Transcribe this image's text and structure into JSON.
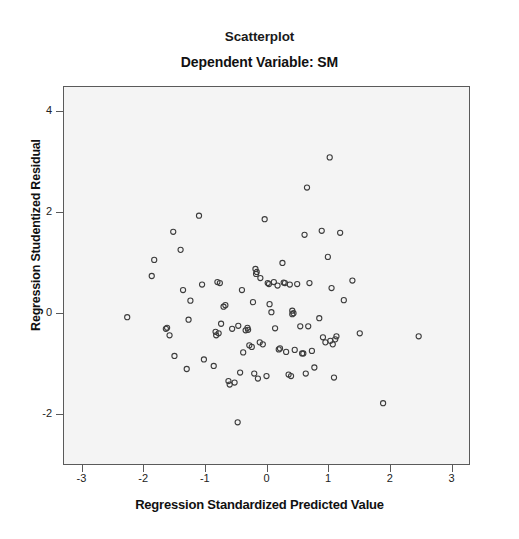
{
  "figure": {
    "title": "Scatterplot",
    "subtitle": "Dependent Variable: SM"
  },
  "chart_data": {
    "type": "scatter",
    "title": "Scatterplot",
    "subtitle": "Dependent Variable: SM",
    "xlabel": "Regression Standardized Predicted Value",
    "ylabel": "Regression Studentized Residual",
    "xlim": [
      -3.3,
      3.3
    ],
    "ylim": [
      -3.0,
      4.5
    ],
    "xticks": [
      -3,
      -2,
      -1,
      0,
      1,
      2,
      3
    ],
    "xtick_labels": [
      "-3",
      "-2",
      "-1",
      "0",
      "1",
      "2",
      "3"
    ],
    "yticks": [
      -2,
      0,
      2,
      4
    ],
    "ytick_labels": [
      "-2",
      "0",
      "2",
      "4"
    ],
    "grid": false,
    "legend": null,
    "marker": {
      "shape": "open-circle",
      "radius": 2.6,
      "stroke": "#3c3c3c",
      "stroke_width": 1.1,
      "fill": "none"
    },
    "plot_background": "#f4f4f4",
    "frame_color": "#5a5a5a",
    "n_points": 98,
    "points": [
      [
        -2.27,
        -0.08
      ],
      [
        -1.83,
        1.06
      ],
      [
        -1.87,
        0.74
      ],
      [
        -1.62,
        -0.29
      ],
      [
        -1.58,
        -0.44
      ],
      [
        -1.52,
        1.62
      ],
      [
        -1.5,
        -0.85
      ],
      [
        -1.4,
        1.26
      ],
      [
        -1.36,
        0.46
      ],
      [
        -1.3,
        -1.11
      ],
      [
        -1.24,
        0.25
      ],
      [
        -1.27,
        -0.13
      ],
      [
        -1.1,
        1.94
      ],
      [
        -1.05,
        0.57
      ],
      [
        -1.02,
        -0.92
      ],
      [
        -0.86,
        -1.05
      ],
      [
        -0.8,
        0.62
      ],
      [
        -0.76,
        0.6
      ],
      [
        -0.83,
        -0.37
      ],
      [
        -0.82,
        -0.44
      ],
      [
        -0.74,
        -0.21
      ],
      [
        -0.7,
        0.13
      ],
      [
        -0.67,
        0.16
      ],
      [
        -0.62,
        -1.35
      ],
      [
        -0.6,
        -1.42
      ],
      [
        -0.56,
        -0.31
      ],
      [
        -0.47,
        -2.17
      ],
      [
        -0.43,
        -1.18
      ],
      [
        -0.4,
        0.46
      ],
      [
        -0.38,
        -0.78
      ],
      [
        -0.34,
        -0.34
      ],
      [
        -0.3,
        -0.33
      ],
      [
        -0.28,
        -0.64
      ],
      [
        -0.24,
        -0.67
      ],
      [
        -0.22,
        0.22
      ],
      [
        -0.18,
        0.88
      ],
      [
        -0.17,
        0.78
      ],
      [
        -0.2,
        -1.2
      ],
      [
        -0.14,
        -1.3
      ],
      [
        -0.1,
        0.7
      ],
      [
        -0.06,
        -0.62
      ],
      [
        -0.03,
        1.87
      ],
      [
        0.0,
        -1.25
      ],
      [
        0.02,
        0.6
      ],
      [
        0.05,
        0.18
      ],
      [
        0.08,
        0.02
      ],
      [
        0.12,
        0.62
      ],
      [
        0.14,
        -0.3
      ],
      [
        0.18,
        0.55
      ],
      [
        0.22,
        -0.7
      ],
      [
        0.26,
        1.0
      ],
      [
        0.28,
        0.61
      ],
      [
        0.32,
        -0.77
      ],
      [
        0.36,
        -1.22
      ],
      [
        0.4,
        -1.25
      ],
      [
        0.42,
        0.05
      ],
      [
        0.42,
        -0.02
      ],
      [
        0.46,
        -0.73
      ],
      [
        0.5,
        0.58
      ],
      [
        0.55,
        -0.26
      ],
      [
        0.58,
        -0.8
      ],
      [
        0.62,
        1.56
      ],
      [
        0.66,
        2.5
      ],
      [
        0.7,
        0.6
      ],
      [
        0.74,
        -0.75
      ],
      [
        0.78,
        -1.08
      ],
      [
        0.86,
        -0.1
      ],
      [
        0.9,
        1.64
      ],
      [
        0.92,
        -0.48
      ],
      [
        0.96,
        -0.58
      ],
      [
        1.0,
        1.12
      ],
      [
        1.03,
        3.1
      ],
      [
        1.06,
        0.5
      ],
      [
        1.08,
        -0.62
      ],
      [
        1.1,
        -1.28
      ],
      [
        1.14,
        -0.46
      ],
      [
        1.2,
        1.6
      ],
      [
        1.26,
        0.26
      ],
      [
        1.4,
        0.65
      ],
      [
        1.52,
        -0.4
      ],
      [
        1.9,
        -1.79
      ],
      [
        2.48,
        -0.46
      ],
      [
        -1.64,
        -0.31
      ],
      [
        -0.78,
        -0.4
      ],
      [
        -0.46,
        -0.25
      ],
      [
        -0.31,
        -0.29
      ],
      [
        0.04,
        0.58
      ],
      [
        0.38,
        0.57
      ],
      [
        0.44,
        0.0
      ],
      [
        0.6,
        -0.8
      ],
      [
        0.64,
        -1.2
      ],
      [
        1.04,
        -0.55
      ],
      [
        1.12,
        -0.52
      ],
      [
        -0.11,
        -0.58
      ],
      [
        -0.16,
        0.82
      ],
      [
        0.2,
        -0.72
      ],
      [
        0.68,
        -0.26
      ],
      [
        0.3,
        0.6
      ],
      [
        -0.52,
        -1.38
      ]
    ]
  }
}
